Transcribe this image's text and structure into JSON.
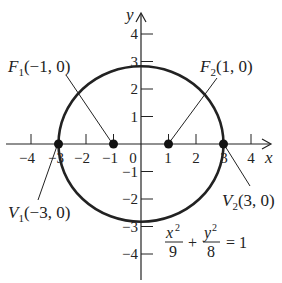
{
  "axes": {
    "x_label": "x",
    "y_label": "y",
    "x_ticks": [
      "−4",
      "−3",
      "−2",
      "−1",
      "0",
      "1",
      "2",
      "3",
      "4"
    ],
    "y_ticks": [
      "4",
      "3",
      "2",
      "1",
      "−1",
      "−2",
      "−3",
      "−4"
    ]
  },
  "ellipse": {
    "a": 3,
    "b2": 8,
    "color": "#222222"
  },
  "points": {
    "f1": {
      "name": "F",
      "sub": "1",
      "coords": "(−1, 0)"
    },
    "f2": {
      "name": "F",
      "sub": "2",
      "coords": "(1, 0)"
    },
    "v1": {
      "name": "V",
      "sub": "1",
      "coords": "(−3, 0)"
    },
    "v2": {
      "name": "V",
      "sub": "2",
      "coords": "(3, 0)"
    }
  },
  "equation": {
    "num1": "x",
    "den1": "9",
    "num2": "y",
    "den2": "8",
    "exp": "2",
    "plus": "+",
    "rhs": "= 1"
  }
}
